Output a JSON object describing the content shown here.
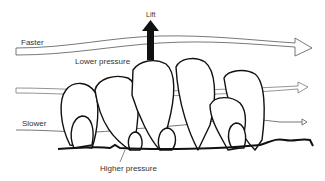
{
  "diagram": {
    "labels": {
      "lift": "Lift",
      "faster": "Faster",
      "lower_pressure": "Lower pressure",
      "slower": "Slower",
      "higher_pressure": "Higher pressure"
    },
    "arrows": [
      {
        "name": "fast-flow-arrow",
        "style": "hollow-wide"
      },
      {
        "name": "mid-flow-arrow",
        "style": "hollow-medium"
      },
      {
        "name": "slow-flow-arrow",
        "style": "thin"
      },
      {
        "name": "lift-arrow",
        "style": "solid-black",
        "direction": "up"
      }
    ],
    "colors": {
      "stroke": "#111111",
      "flow_stroke": "#555555",
      "text": "#333333",
      "background": "#ffffff"
    }
  }
}
